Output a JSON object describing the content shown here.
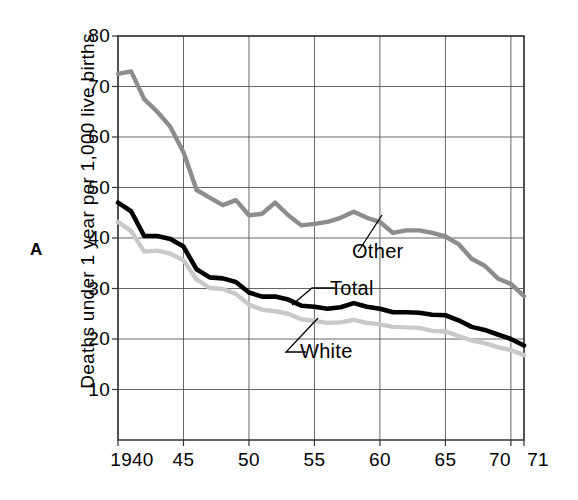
{
  "figure": {
    "panel_letter": "A",
    "ylabel": "Deaths under 1 year per 1,000 live births"
  },
  "annotations": {
    "other": "Other",
    "total": "Total",
    "white": "White"
  },
  "axes": {
    "y_ticks": [
      "80",
      "70",
      "60",
      "50",
      "40",
      "30",
      "20",
      "10"
    ],
    "x_ticks": [
      "1940",
      "45",
      "50",
      "55",
      "60",
      "65",
      "70",
      "71"
    ]
  },
  "chart_data": {
    "type": "line",
    "title": "",
    "xlabel": "",
    "ylabel": "Deaths under 1 year per 1,000 live births",
    "xlim": [
      1940,
      1971
    ],
    "ylim": [
      0,
      80
    ],
    "grid": true,
    "legend": "inline-annotations",
    "x": [
      1940,
      1941,
      1942,
      1943,
      1944,
      1945,
      1946,
      1947,
      1948,
      1949,
      1950,
      1951,
      1952,
      1953,
      1954,
      1955,
      1956,
      1957,
      1958,
      1959,
      1960,
      1961,
      1962,
      1963,
      1964,
      1965,
      1966,
      1967,
      1968,
      1969,
      1970,
      1971
    ],
    "series": [
      {
        "name": "Other",
        "color": "#8c8c8c",
        "values": [
          72.5,
          73.0,
          67.5,
          65.0,
          62.0,
          57.0,
          49.5,
          48.0,
          46.5,
          47.5,
          44.5,
          44.8,
          47.0,
          44.5,
          42.5,
          42.8,
          43.2,
          44.0,
          45.2,
          44.0,
          43.2,
          41.0,
          41.5,
          41.5,
          41.0,
          40.3,
          38.8,
          35.9,
          34.5,
          32.0,
          30.9,
          28.5
        ]
      },
      {
        "name": "Total",
        "color": "#000000",
        "values": [
          47.0,
          45.3,
          40.4,
          40.4,
          39.8,
          38.3,
          33.8,
          32.2,
          32.0,
          31.3,
          29.2,
          28.4,
          28.4,
          27.8,
          26.6,
          26.4,
          26.0,
          26.3,
          27.1,
          26.4,
          26.0,
          25.3,
          25.3,
          25.2,
          24.8,
          24.7,
          23.7,
          22.4,
          21.8,
          20.9,
          20.0,
          18.7
        ]
      },
      {
        "name": "White",
        "color": "#c9c9c9",
        "values": [
          43.2,
          41.4,
          37.3,
          37.5,
          36.9,
          35.6,
          31.8,
          30.1,
          29.9,
          28.9,
          26.8,
          25.8,
          25.5,
          25.0,
          23.9,
          23.6,
          23.2,
          23.3,
          23.8,
          23.2,
          22.9,
          22.4,
          22.3,
          22.2,
          21.6,
          21.5,
          20.6,
          19.7,
          19.2,
          18.4,
          17.8,
          16.8
        ]
      }
    ]
  },
  "geometry": {
    "plot_left": 118,
    "plot_right": 524,
    "plot_top": 36,
    "plot_bottom": 440,
    "x_tick_years": [
      1940,
      1945,
      1950,
      1955,
      1960,
      1965,
      1970,
      1971
    ],
    "y_tick_values": [
      80,
      70,
      60,
      50,
      40,
      30,
      20,
      10
    ]
  }
}
